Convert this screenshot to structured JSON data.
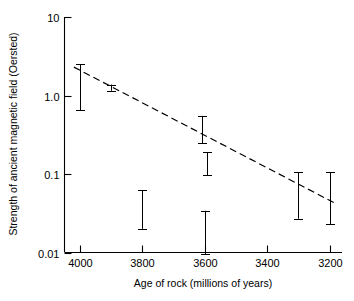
{
  "chart_data": {
    "type": "scatter",
    "title": "",
    "xlabel": "Age of rock (millions of years)",
    "ylabel": "Strength of ancient magnetic field (Oersted)",
    "xlim": [
      4050,
      3160
    ],
    "ylim": [
      0.01,
      10
    ],
    "yscale": "log",
    "xscale": "linear",
    "x_reversed": true,
    "grid": false,
    "legend": "none",
    "xticks": [
      4000,
      3800,
      3600,
      3400,
      3200
    ],
    "xtick_labels": [
      "4000",
      "3800",
      "3600",
      "3400",
      "3200"
    ],
    "yticks": [
      10,
      1.0,
      0.1,
      0.01
    ],
    "ytick_labels": [
      "10",
      "1.0",
      "0.1",
      "0.01"
    ],
    "error_bars": [
      {
        "name": "point-4000",
        "x": 4000,
        "low": 0.65,
        "high": 2.5,
        "caps": "both"
      },
      {
        "name": "point-3900",
        "x": 3900,
        "low": 1.15,
        "high": 1.38,
        "caps": "both"
      },
      {
        "name": "point-3800",
        "x": 3800,
        "low": 0.02,
        "high": 0.062,
        "caps": "both"
      },
      {
        "name": "point-3600-a",
        "x": 3608,
        "low": 0.245,
        "high": 0.55,
        "caps": "both"
      },
      {
        "name": "point-3600-b",
        "x": 3594,
        "low": 0.097,
        "high": 0.19,
        "caps": "both"
      },
      {
        "name": "point-3600-c",
        "x": 3600,
        "low": 0.0095,
        "high": 0.034,
        "caps": "both"
      },
      {
        "name": "point-3300",
        "x": 3300,
        "low": 0.027,
        "high": 0.105,
        "caps": "both"
      },
      {
        "name": "point-3200",
        "x": 3200,
        "low": 0.023,
        "high": 0.105,
        "caps": "both"
      }
    ],
    "trend_line": {
      "name": "dashed-regression-line",
      "style": "dashed",
      "x_start": 4020,
      "y_start": 2.3,
      "x_end": 3185,
      "y_end": 0.043
    },
    "series": [
      {
        "name": "Paleointensity measurements",
        "x": [
          4000,
          3900,
          3800,
          3608,
          3594,
          3600,
          3300,
          3200
        ],
        "y": [
          1.28,
          1.26,
          0.035,
          0.367,
          0.136,
          0.018,
          0.053,
          0.049
        ]
      }
    ]
  }
}
